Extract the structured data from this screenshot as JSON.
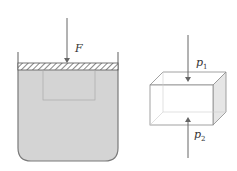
{
  "diagram": {
    "left_figure": {
      "description": "Container filled with liquid, piston on top pressed by force",
      "force_label": "F",
      "colors": {
        "liquid": "#d4d4d4",
        "outline": "#7a7a7a",
        "hatch": "#555555"
      }
    },
    "right_figure": {
      "description": "Rectangular prism with pressure arrows on top and bottom",
      "top_label": "p",
      "top_subscript": "1",
      "bottom_label": "p",
      "bottom_subscript": "2",
      "colors": {
        "outline": "#8a8a8a",
        "side_face": "#e6e6e6"
      }
    }
  }
}
